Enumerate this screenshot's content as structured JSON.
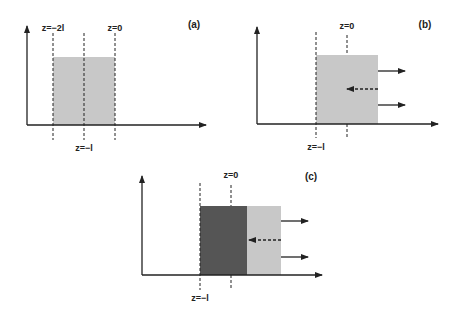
{
  "colors": {
    "light_fill": "#c8c8c8",
    "dark_fill": "#555555",
    "line": "#222222"
  },
  "panels": [
    {
      "id": "a",
      "label": "(a)",
      "markers": {
        "left_top": "z=−2l",
        "right_top": "z=0",
        "middle_bottom": "z=−l"
      }
    },
    {
      "id": "b",
      "label": "(b)",
      "markers": {
        "top": "z=0",
        "bottom": "z=−l"
      },
      "arrows": [
        "outgoing-upper",
        "incoming-dashed",
        "outgoing-lower"
      ]
    },
    {
      "id": "c",
      "label": "(c)",
      "markers": {
        "top": "z=0",
        "bottom": "z=−l"
      },
      "arrows": [
        "outgoing-upper",
        "incoming-dashed",
        "outgoing-lower"
      ]
    }
  ]
}
